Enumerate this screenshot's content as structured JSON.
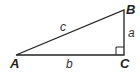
{
  "diagram": {
    "type": "right-triangle",
    "vertices": [
      {
        "id": "A",
        "label": "A",
        "x": 16,
        "y": 55
      },
      {
        "id": "B",
        "label": "B",
        "x": 124,
        "y": 10
      },
      {
        "id": "C",
        "label": "C",
        "x": 124,
        "y": 55
      }
    ],
    "sides": [
      {
        "id": "a",
        "label": "a",
        "from": "B",
        "to": "C"
      },
      {
        "id": "b",
        "label": "b",
        "from": "A",
        "to": "C"
      },
      {
        "id": "c",
        "label": "c",
        "from": "A",
        "to": "B"
      }
    ],
    "right_angle_at": "C",
    "line_color": "#222222"
  }
}
